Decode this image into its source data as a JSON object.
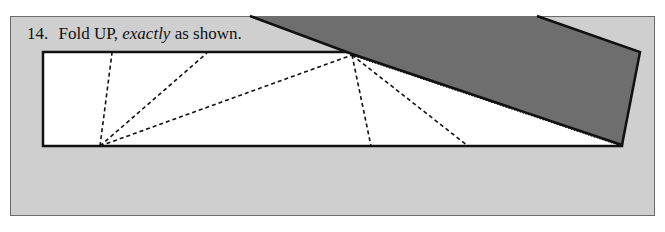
{
  "step": {
    "number": "14.",
    "text_before": "Fold UP,",
    "text_emphasis": "exactly",
    "text_after": "as shown."
  },
  "colors": {
    "panel_background": "#cfcfcf",
    "paper": "#ffffff",
    "folded_flap": "#6e6e6e",
    "outline": "#111111"
  }
}
